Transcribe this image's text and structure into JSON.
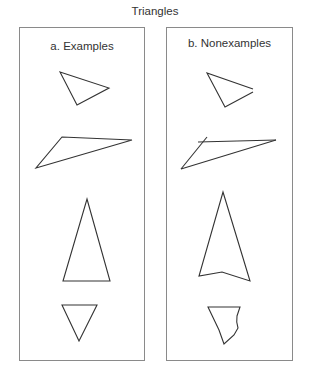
{
  "title": "Triangles",
  "panels": [
    {
      "id": "a",
      "label": "a. Examples"
    },
    {
      "id": "b",
      "label": "b. Nonexamples"
    }
  ],
  "colors": {
    "stroke": "#333333",
    "border": "#8a8a8a",
    "background": "#ffffff"
  },
  "shapes": {
    "examples": [
      {
        "name": "small-scalene-triangle",
        "points": "60,72 109,88 77,105"
      },
      {
        "name": "long-obtuse-triangle",
        "points": "62,137 132,140 36,168"
      },
      {
        "name": "tall-isosceles-triangle",
        "points": "87,199 110,281 63,281"
      },
      {
        "name": "inverted-triangle",
        "points": "62,305 97,305 79,341"
      }
    ],
    "nonexamples": [
      {
        "name": "open-triangle",
        "description": "sides do not meet"
      },
      {
        "name": "overlapping-sides-triangle",
        "description": "sides extend past vertex"
      },
      {
        "name": "notched-arrow-shape",
        "description": "four sides"
      },
      {
        "name": "curved-side-shape",
        "description": "non-straight side"
      }
    ]
  }
}
